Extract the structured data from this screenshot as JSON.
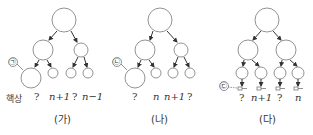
{
  "panels": [
    {
      "caption": "(가)",
      "marker": "㉠",
      "leaf_labels": [
        "핵상",
        "?",
        "n+1",
        "?",
        "n−1"
      ]
    },
    {
      "caption": "(나)",
      "marker": "㉡",
      "leaf_labels": [
        "?",
        "n",
        "n+1",
        "?"
      ]
    },
    {
      "caption": "(다)",
      "marker": "㉢",
      "leaf_labels": [
        "?",
        "n+1",
        "?",
        "n"
      ]
    }
  ]
}
